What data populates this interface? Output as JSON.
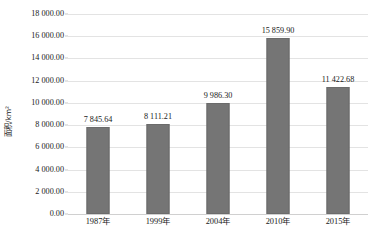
{
  "chart_data": {
    "type": "bar",
    "title": "",
    "xlabel": "",
    "ylabel": "面积/km²",
    "categories": [
      "1987年",
      "1999年",
      "2004年",
      "2010年",
      "2015年"
    ],
    "values": [
      7845.64,
      8111.21,
      9986.3,
      15859.9,
      11422.68
    ],
    "value_labels": [
      "7 845.64",
      "8 111.21",
      "9 986.30",
      "15 859.90",
      "11 422.68"
    ],
    "ylim": [
      0,
      18000
    ],
    "ytick_step": 2000,
    "ytick_labels": [
      "18 000.00",
      "16 000.00",
      "14 000.00",
      "12 000.00",
      "10 000.00",
      "8 000.00",
      "6 000.00",
      "4 000.00",
      "2 000.00",
      "0.00"
    ],
    "ytick_values": [
      18000,
      16000,
      14000,
      12000,
      10000,
      8000,
      6000,
      4000,
      2000,
      0
    ],
    "grid": true,
    "legend": false,
    "legend_position": "none",
    "bar_color": "#757575",
    "gridline_color": "#e3e3e3",
    "text_color": "#1a1a1a",
    "background_color": "#ffffff"
  }
}
